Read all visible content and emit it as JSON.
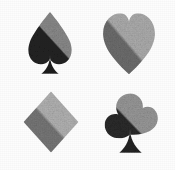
{
  "canvas": {
    "width": 175,
    "height": 170,
    "background_color": "#fdfdfd",
    "texture": "grainy-halftone-noise",
    "layout": "2x2-grid"
  },
  "palette": {
    "background": "#fdfdfd",
    "spade_dark": "#242424",
    "spade_light": "#8c8c8c",
    "heart_dark": "#6e6e6e",
    "heart_light": "#aeaeae",
    "diamond_dark": "#787878",
    "diamond_light": "#b4b4b4",
    "club_dark": "#2c2c2c",
    "club_light": "#9a9a9a"
  },
  "lighting": {
    "direction": "upper-right",
    "boundary_angle_deg": 45,
    "style": "hard-diagonal-split"
  },
  "suits": [
    {
      "id": "spade",
      "name": "Spade",
      "glyph": "♠",
      "grid_position": "top-left",
      "dark_color": "#242424",
      "light_color": "#8c8c8c",
      "tone": "dark"
    },
    {
      "id": "heart",
      "name": "Heart",
      "glyph": "♥",
      "grid_position": "top-right",
      "dark_color": "#6e6e6e",
      "light_color": "#aeaeae",
      "tone": "mid"
    },
    {
      "id": "diamond",
      "name": "Diamond",
      "glyph": "♦",
      "grid_position": "bottom-left",
      "dark_color": "#787878",
      "light_color": "#b4b4b4",
      "tone": "mid"
    },
    {
      "id": "club",
      "name": "Club",
      "glyph": "♣",
      "grid_position": "bottom-right",
      "dark_color": "#2c2c2c",
      "light_color": "#9a9a9a",
      "tone": "dark"
    }
  ]
}
